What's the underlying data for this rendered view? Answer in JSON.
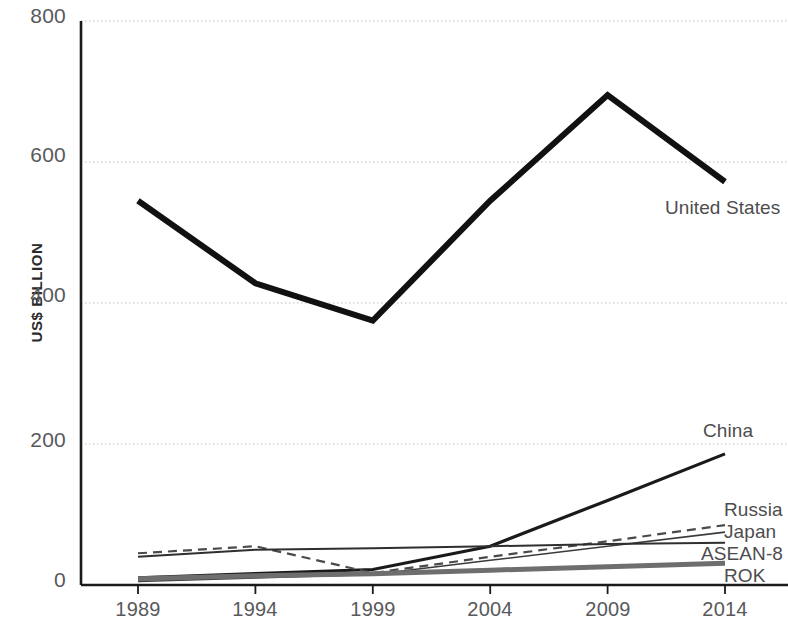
{
  "chart_data": {
    "type": "line",
    "title": "",
    "subtitle": "",
    "xlabel": "",
    "ylabel": "US$ BILLION",
    "categories": [
      "1989",
      "1994",
      "1999",
      "2004",
      "2009",
      "2014"
    ],
    "x": [
      1989,
      1994,
      1999,
      2004,
      2009,
      2014
    ],
    "xlim": [
      1989,
      2014
    ],
    "ylim": [
      0,
      800
    ],
    "yticks": [
      0,
      200,
      400,
      600,
      800
    ],
    "grid": "horizontal-dotted",
    "legend": "inline-right-end-labels",
    "series": [
      {
        "name": "United States",
        "values": [
          545,
          428,
          375,
          545,
          695,
          572
        ],
        "style": "solid",
        "width": 6,
        "color": "#111111",
        "label_x": 2014,
        "label_y": 520
      },
      {
        "name": "China",
        "values": [
          10,
          16,
          22,
          55,
          120,
          186
        ],
        "style": "solid",
        "width": 3.2,
        "color": "#1a1a1a",
        "label_x": 2014,
        "label_y": 222
      },
      {
        "name": "Russia",
        "values": [
          5,
          10,
          15,
          35,
          55,
          75
        ],
        "style": "solid",
        "width": 1.6,
        "color": "#3a3a3a",
        "label_x": 2014,
        "label_y": 110
      },
      {
        "name": "Japan",
        "values": [
          45,
          55,
          17,
          40,
          62,
          85
        ],
        "style": "dashed",
        "width": 2.2,
        "color": "#4a4a4a",
        "label_x": 2014,
        "label_y": 80
      },
      {
        "name": "ASEAN-8",
        "values": [
          40,
          50,
          52,
          55,
          58,
          60
        ],
        "style": "solid",
        "width": 2.0,
        "color": "#2f2f2f",
        "label_x": 2014,
        "label_y": 48
      },
      {
        "name": "ROK",
        "values": [
          9,
          13,
          16,
          21,
          26,
          31
        ],
        "style": "solid",
        "width": 5.0,
        "color": "#6e6e6e",
        "label_x": 2014,
        "label_y": 16
      }
    ]
  },
  "axes": {
    "y_tick_labels": [
      "800",
      "600",
      "400",
      "200",
      "0"
    ],
    "x_tick_labels": [
      "1989",
      "1994",
      "1999",
      "2004",
      "2009",
      "2014"
    ],
    "y_axis_title": "US$ BILLION"
  },
  "labels": {
    "united_states": "United States",
    "china": "China",
    "russia": "Russia",
    "japan": "Japan",
    "asean8": "ASEAN-8",
    "rok": "ROK"
  },
  "colors": {
    "background": "#ffffff",
    "axis": "#1a1a1a",
    "grid": "#b9b9b9",
    "tick_text": "#58595b",
    "label_text": "#4d4d4f"
  }
}
